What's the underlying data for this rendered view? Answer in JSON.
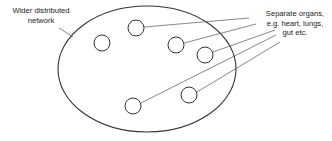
{
  "diagram": {
    "labels": {
      "network": {
        "line1": "Wider distributed",
        "line2": "network"
      },
      "organs": {
        "line1": "Separate organs,",
        "line2": "e.g. heart, lungs,",
        "line3": "gut etc."
      }
    },
    "colors": {
      "stroke": "#333333",
      "leader": "#555555",
      "text": "#222222",
      "background": "#ffffff"
    },
    "shapes": {
      "network_ellipse": {
        "cx": 147,
        "cy": 69,
        "rx": 89,
        "ry": 63
      },
      "organ_circles": [
        {
          "cx": 102,
          "cy": 43,
          "r": 8
        },
        {
          "cx": 136,
          "cy": 28,
          "r": 8
        },
        {
          "cx": 176,
          "cy": 45,
          "r": 8
        },
        {
          "cx": 205,
          "cy": 55,
          "r": 8
        },
        {
          "cx": 133,
          "cy": 106,
          "r": 8
        },
        {
          "cx": 189,
          "cy": 95,
          "r": 8
        }
      ]
    }
  }
}
